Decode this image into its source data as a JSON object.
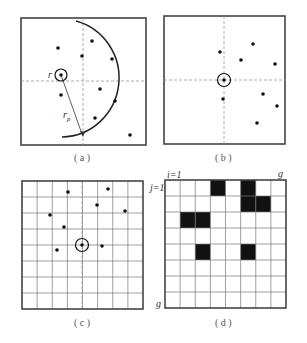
{
  "panels": {
    "a": {
      "caption": "( a )",
      "label_r": "r",
      "label_rp": "r",
      "label_rp_sub": "p",
      "box": [
        21,
        18,
        125,
        127
      ],
      "crosshair": {
        "x": 83,
        "y": 81
      },
      "center": [
        61,
        75
      ],
      "ring_radius": 6,
      "points": [
        [
          58,
          48
        ],
        [
          92,
          41
        ],
        [
          82,
          56
        ],
        [
          112,
          59
        ],
        [
          61,
          95
        ],
        [
          100,
          89
        ],
        [
          115,
          101
        ],
        [
          95,
          118
        ],
        [
          130,
          135
        ]
      ],
      "arrow_end": [
        83,
        136
      ]
    },
    "b": {
      "caption": "( b )",
      "box": [
        164,
        16,
        121,
        128
      ],
      "crosshair": {
        "x": 224,
        "y": 80
      },
      "center": [
        224,
        80
      ],
      "ring_radius": 6.5,
      "points": [
        [
          220,
          52
        ],
        [
          253,
          44
        ],
        [
          241,
          60
        ],
        [
          275,
          64
        ],
        [
          223,
          99
        ],
        [
          263,
          94
        ],
        [
          277,
          106
        ],
        [
          257,
          123
        ]
      ]
    },
    "c": {
      "caption": "( c )",
      "box": [
        22,
        181,
        121,
        128
      ],
      "grid_size": 8,
      "dashed_x": 82,
      "center": [
        82,
        245
      ],
      "ring_radius": 6.5,
      "points": [
        [
          68,
          192
        ],
        [
          108,
          189
        ],
        [
          97,
          205
        ],
        [
          125,
          211
        ],
        [
          50,
          215
        ],
        [
          64,
          227
        ],
        [
          102,
          246
        ],
        [
          57,
          250
        ]
      ]
    },
    "d": {
      "caption": "( d )",
      "box": [
        165,
        180,
        121,
        128
      ],
      "grid_size": 8,
      "label_i": "i=1",
      "label_j": "j=1",
      "label_g_top": "g",
      "label_g_left": "g",
      "filled_cells": [
        [
          3,
          0
        ],
        [
          5,
          0
        ],
        [
          5,
          1
        ],
        [
          6,
          1
        ],
        [
          1,
          2
        ],
        [
          2,
          2
        ],
        [
          2,
          4
        ],
        [
          5,
          4
        ]
      ]
    }
  }
}
